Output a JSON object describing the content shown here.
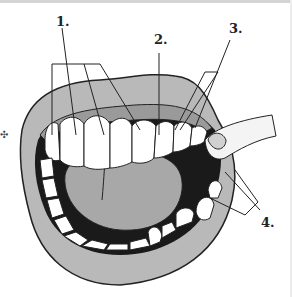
{
  "diagram": {
    "labels": [
      {
        "id": "1",
        "text": "1.",
        "x": 56,
        "y": 16
      },
      {
        "id": "2",
        "text": "2.",
        "x": 154,
        "y": 34
      },
      {
        "id": "3",
        "text": "3.",
        "x": 229,
        "y": 23
      },
      {
        "id": "4",
        "text": "4.",
        "x": 261,
        "y": 217
      }
    ],
    "colors": {
      "lip": "#b9b9b9",
      "gum": "#9a9a9a",
      "tongue": "#a8a8a8",
      "mouth_interior": "#1a1a1a",
      "tooth": "#ffffff",
      "outline": "#222222"
    }
  }
}
